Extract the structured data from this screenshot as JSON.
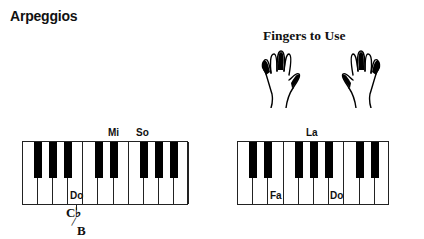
{
  "title": "Arpeggios",
  "fingers": {
    "title": "Fingers to Use",
    "left_hand": {
      "highlighted_fingers": [
        "thumb",
        "middle",
        "pinky"
      ]
    },
    "right_hand": {
      "highlighted_fingers": [
        "thumb",
        "middle",
        "pinky"
      ]
    }
  },
  "keyboards": [
    {
      "name": "left-keyboard",
      "white_key_count": 11,
      "black_key_after_white": [
        1,
        2,
        3,
        6,
        7,
        9,
        10,
        11
      ],
      "labels_on_white": [
        {
          "key": 4,
          "text": "Do"
        }
      ],
      "labels_above_black": [
        {
          "after_white": 7,
          "text": "Mi"
        },
        {
          "after_white": 9,
          "text": "So"
        }
      ]
    },
    {
      "name": "right-keyboard",
      "white_key_count": 10,
      "black_key_after_white": [
        1,
        2,
        4,
        5,
        6,
        8,
        9
      ],
      "labels_on_white": [
        {
          "key": 3,
          "text": "Fa"
        },
        {
          "key": 7,
          "text": "Do"
        }
      ],
      "labels_above_black": [
        {
          "after_white": 5,
          "text": "La"
        }
      ]
    }
  ],
  "labels": {
    "left_do": "Do",
    "mi": "Mi",
    "so": "So",
    "la": "La",
    "fa": "Fa",
    "right_do": "Do"
  },
  "annotation": {
    "top": "C♭",
    "bottom": "B",
    "slash": "/"
  }
}
